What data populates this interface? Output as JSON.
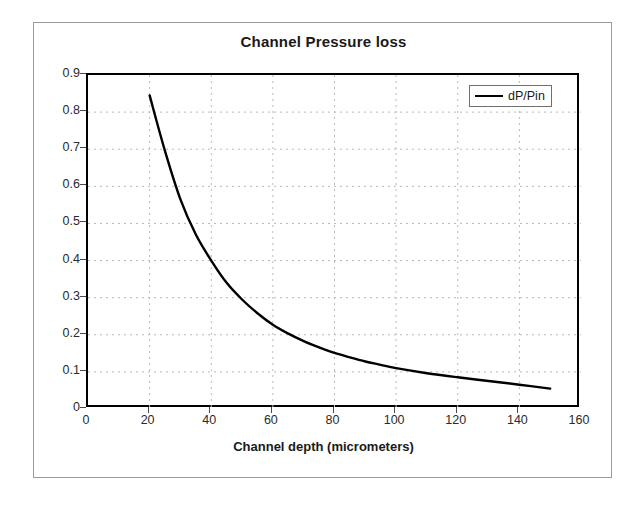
{
  "chart_data": {
    "type": "line",
    "title": "Channel Pressure loss",
    "xlabel": "Channel depth (micrometers)",
    "ylabel": "",
    "xlim": [
      0,
      160
    ],
    "ylim": [
      0,
      0.9
    ],
    "grid": true,
    "legend_position": "top-right",
    "x_ticks": [
      "0",
      "20",
      "40",
      "60",
      "80",
      "100",
      "120",
      "140",
      "160"
    ],
    "x_tick_values": [
      0,
      20,
      40,
      60,
      80,
      100,
      120,
      140,
      160
    ],
    "y_ticks": [
      "0",
      "0.1",
      "0.2",
      "0.3",
      "0.4",
      "0.5",
      "0.6",
      "0.7",
      "0.8",
      "0.9"
    ],
    "y_tick_values": [
      0,
      0.1,
      0.2,
      0.3,
      0.4,
      0.5,
      0.6,
      0.7,
      0.8,
      0.9
    ],
    "series": [
      {
        "name": "dP/Pin",
        "color": "#000000",
        "x": [
          20,
          25,
          30,
          35,
          40,
          45,
          50,
          55,
          60,
          65,
          70,
          75,
          80,
          85,
          90,
          95,
          100,
          110,
          120,
          130,
          140,
          150
        ],
        "values": [
          0.845,
          0.695,
          0.565,
          0.47,
          0.4,
          0.34,
          0.295,
          0.258,
          0.227,
          0.203,
          0.183,
          0.166,
          0.151,
          0.139,
          0.128,
          0.119,
          0.11,
          0.0965,
          0.0855,
          0.0755,
          0.0655,
          0.055
        ]
      }
    ]
  },
  "legend": {
    "entries": [
      {
        "label": "dP/Pin"
      }
    ]
  }
}
